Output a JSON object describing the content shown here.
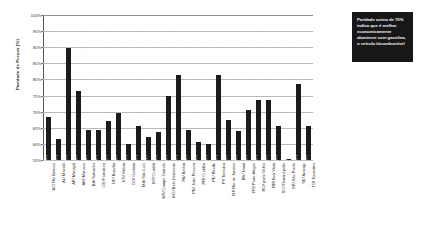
{
  "chart_data": {
    "type": "bar",
    "title": "",
    "xlabel": "",
    "ylabel": "Paridade de Preços (%)",
    "ylim": [
      55,
      100
    ],
    "ytick_labels": [
      "100%",
      "95%",
      "90%",
      "85%",
      "80%",
      "75%",
      "70%",
      "65%",
      "60%",
      "55%"
    ],
    "ytick_values": [
      100,
      95,
      90,
      85,
      80,
      75,
      70,
      65,
      60,
      55
    ],
    "grid": true,
    "legend": null,
    "bar_color": "#1c1c1c",
    "categories": [
      "AC/ Rio Branco",
      "AL/ Maceió",
      "AP/ Macapá",
      "AM/ Manaus",
      "BA/ Salvador",
      "CE/ Fortaleza",
      "DF/ Brasília",
      "ES/ Vitória",
      "GO/ Goiânia",
      "MA/ São Luís",
      "MT/ Cuiabá",
      "MS/ Campo Grande",
      "MG/ Belo Horizonte",
      "PA/ Belém",
      "PB/ João Pessoa",
      "PR/ Curitiba",
      "PE/ Recife",
      "PI/ Teresina",
      "RJ/ Rio de Janeiro",
      "RN/ Natal",
      "RS/ Porto Alegre",
      "RO/ porto Velho",
      "RR/ Boa Vista",
      "SC/ Florianópolis",
      "SP/ São Paulo",
      "SE/ Aracaju",
      "TO/ Tocantins"
    ],
    "values": [
      68.5,
      61.5,
      89.7,
      76.5,
      64.4,
      64.4,
      67.2,
      69.5,
      60.0,
      65.5,
      62.1,
      63.6,
      75.0,
      81.5,
      64.4,
      60.6,
      59.9,
      81.5,
      67.5,
      63.9,
      70.5,
      73.5,
      73.5,
      65.5,
      55.4,
      78.5,
      65.5
    ],
    "value_labels": [
      "68.5%",
      "61.5%",
      "89.7%",
      "76.5%",
      "64.4%",
      "64.4%",
      "67.2%",
      "69.5%",
      "60.0%",
      "65.5%",
      "62.1%",
      "63.6%",
      "75.0%",
      "81.5%",
      "64.4%",
      "60.6%",
      "59.9%",
      "81.5%",
      "67.5%",
      "63.9%",
      "70.5%",
      "73.5%",
      "73.5%",
      "65.5%",
      "55.4%",
      "78.5%",
      "65.5%"
    ]
  },
  "annotation": {
    "text": "Paridade acima de 70% indica que é melhor economicamente abastecer com gasolina, o veículo bicombustível",
    "background": "#171717",
    "color": "#f2f2f2"
  }
}
